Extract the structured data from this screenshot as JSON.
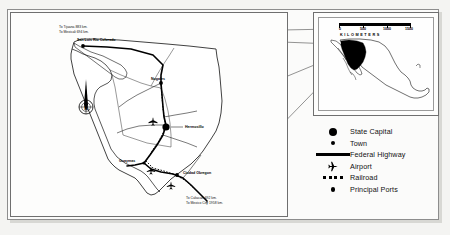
{
  "map": {
    "title": "Sonora, Mexico — Transportation Map",
    "main_panel_name": "State of Sonora",
    "route_notes_north": [
      "To Tijuana 883 km.",
      "To Mexicali 694 km."
    ],
    "route_notes_south": [
      "To Culiacan 692 km.",
      "To Mexico City 1958 km."
    ],
    "cities": [
      {
        "name": "San Luis Rio Colorado",
        "type": "town"
      },
      {
        "name": "Nogales",
        "type": "town"
      },
      {
        "name": "Hermosillo",
        "type": "state-capital"
      },
      {
        "name": "Guaymas",
        "type": "principal-port"
      },
      {
        "name": "Ciudad Obregon",
        "type": "town"
      }
    ],
    "compass": {
      "label": "N",
      "icon": "north-arrow-compass-rose"
    }
  },
  "inset": {
    "country": "Mexico",
    "highlighted_state": "Sonora",
    "scale": {
      "ticks": [
        "0",
        "500",
        "1000",
        "1500"
      ],
      "units": "KILOMETERS",
      "max": 1500
    }
  },
  "legend": {
    "items": [
      {
        "symbol": "large-filled-circle",
        "label": "State Capital"
      },
      {
        "symbol": "small-filled-circle",
        "label": "Town"
      },
      {
        "symbol": "thick-black-line",
        "label": "Federal Highway"
      },
      {
        "symbol": "airplane",
        "label": "Airport"
      },
      {
        "symbol": "dashed-squares",
        "label": "Railroad"
      },
      {
        "symbol": "medium-filled-circle",
        "label": "Principal Ports"
      }
    ]
  },
  "colors": {
    "ink": "#000000",
    "frame": "#6f6f6f",
    "paper": "#fdfdfc",
    "page": "#f2f2f0",
    "highlight": "#000000"
  }
}
